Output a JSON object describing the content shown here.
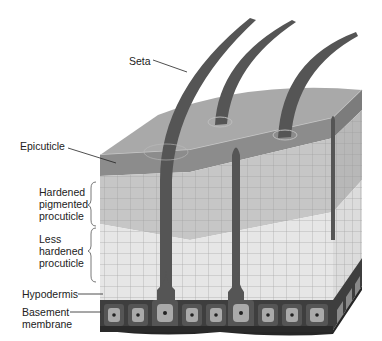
{
  "figure": {
    "labels": {
      "seta": "Seta",
      "epicuticle": "Epicuticle",
      "hardened": "Hardened\npigmented\nprocuticle",
      "less_hardened": "Less\nhardened\nprocuticle",
      "hypodermis": "Hypodermis",
      "basement": "Basement\nmembrane"
    }
  },
  "colors": {
    "top_surface": "#a8a8a8",
    "epicuticle_band": "#8e8e8e",
    "hardened_layer": "#c4c4c4",
    "less_hardened_layer": "#e4e4e4",
    "seta": "#5a5a5a",
    "hypodermis_cell": "#4a4a4a",
    "basement": "#2e2e2e"
  }
}
